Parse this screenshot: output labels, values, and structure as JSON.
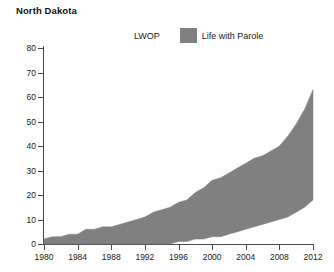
{
  "title": "North Dakota",
  "legend": {
    "position": "top-center",
    "items": [
      {
        "label": "LWOP",
        "color": "#ffffff",
        "swatch": "none"
      },
      {
        "label": "Life with Parole",
        "color": "#808080",
        "swatch": "filled"
      }
    ]
  },
  "axes": {
    "y_ticks": [
      "80",
      "70",
      "60",
      "50",
      "40",
      "30",
      "20",
      "10",
      "0"
    ],
    "x_ticks": [
      "1980",
      "1984",
      "1988",
      "1992",
      "1996",
      "2000",
      "2004",
      "2008",
      "2012"
    ]
  },
  "chart_data": {
    "type": "area",
    "stacked": true,
    "title": "North Dakota",
    "xlabel": "",
    "ylabel": "",
    "xlim": [
      1980,
      2012
    ],
    "ylim": [
      0,
      80
    ],
    "grid": false,
    "legend_position": "top-center",
    "x": [
      1980,
      1981,
      1982,
      1983,
      1984,
      1985,
      1986,
      1987,
      1988,
      1989,
      1990,
      1991,
      1992,
      1993,
      1994,
      1995,
      1996,
      1997,
      1998,
      1999,
      2000,
      2001,
      2002,
      2003,
      2004,
      2005,
      2006,
      2007,
      2008,
      2009,
      2010,
      2011,
      2012
    ],
    "series": [
      {
        "name": "LWOP",
        "color": "#ffffff",
        "values": [
          0,
          0,
          0,
          0,
          0,
          0,
          0,
          0,
          0,
          0,
          0,
          0,
          0,
          0,
          0,
          0,
          1,
          1,
          2,
          2,
          3,
          3,
          4,
          5,
          6,
          7,
          8,
          9,
          10,
          11,
          13,
          15,
          18
        ]
      },
      {
        "name": "Life with Parole",
        "color": "#808080",
        "values": [
          2,
          3,
          3,
          4,
          4,
          6,
          6,
          7,
          7,
          8,
          9,
          10,
          11,
          13,
          14,
          15,
          16,
          17,
          19,
          21,
          23,
          24,
          25,
          26,
          27,
          28,
          28,
          29,
          30,
          33,
          36,
          40,
          45
        ]
      }
    ],
    "totals": [
      2,
      3,
      3,
      4,
      4,
      6,
      6,
      7,
      7,
      8,
      9,
      10,
      11,
      13,
      14,
      15,
      17,
      18,
      21,
      23,
      26,
      27,
      29,
      31,
      33,
      35,
      36,
      38,
      40,
      44,
      49,
      55,
      63
    ]
  }
}
